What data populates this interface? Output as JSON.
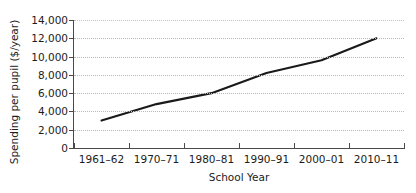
{
  "chart_data": {
    "type": "line",
    "title": "",
    "xlabel": "School Year",
    "ylabel": "Spending per pupil ($/year)",
    "categories": [
      "1961–62",
      "1970–71",
      "1980–81",
      "1990–91",
      "2000–01",
      "2010–11"
    ],
    "x": [
      1961,
      1970,
      1980,
      1990,
      2000,
      2010
    ],
    "values": [
      3000,
      4800,
      6000,
      8200,
      9600,
      12000
    ],
    "series": [
      {
        "name": "Spending per pupil",
        "values": [
          3000,
          4800,
          6000,
          8200,
          9600,
          12000
        ]
      }
    ],
    "ylim": [
      0,
      14000
    ],
    "ytick_labels": [
      "0",
      "2,000",
      "4,000",
      "6,000",
      "8,000",
      "10,000",
      "12,000",
      "14,000"
    ],
    "ytick_values": [
      0,
      2000,
      4000,
      6000,
      8000,
      10000,
      12000,
      14000
    ],
    "grid": true,
    "legend": false,
    "legend_position": "none",
    "line_color": "#1a1a1a",
    "grid_color": "#b9b9b9",
    "axis_color": "#4a4a4a",
    "background_color": "#ffffff"
  }
}
